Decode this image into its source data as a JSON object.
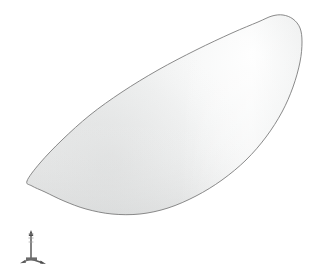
{
  "viewport": {
    "name": "3d-model-viewport",
    "width": 316,
    "height": 274,
    "background_color": "#ffffff",
    "render_mode": "shaded",
    "caption": ""
  },
  "model": {
    "name": "curved-shell-surface",
    "description": "Crescent / lens shaped doubly-curved shell surface",
    "fill_color": "#ececec",
    "highlight_color": "#fafafa",
    "shadow_color": "#dcdddd",
    "edge_color": "#7d7d7d",
    "edge_width": 0.9,
    "outline_points": [
      [
        27,
        181
      ],
      [
        40,
        163
      ],
      [
        62,
        140
      ],
      [
        90,
        115
      ],
      [
        122,
        92
      ],
      [
        158,
        70
      ],
      [
        196,
        50
      ],
      [
        232,
        33
      ],
      [
        258,
        22
      ],
      [
        272,
        16
      ],
      [
        283,
        15
      ],
      [
        293,
        19
      ],
      [
        300,
        28
      ],
      [
        302,
        42
      ],
      [
        300,
        62
      ],
      [
        293,
        87
      ],
      [
        282,
        112
      ],
      [
        266,
        137
      ],
      [
        246,
        160
      ],
      [
        222,
        180
      ],
      [
        196,
        196
      ],
      [
        168,
        208
      ],
      [
        140,
        214
      ],
      [
        112,
        214
      ],
      [
        86,
        209
      ],
      [
        64,
        201
      ],
      [
        45,
        192
      ],
      [
        32,
        186
      ],
      [
        27,
        181
      ]
    ],
    "highlight_center": [
      255,
      55
    ],
    "shade_center": [
      110,
      165
    ]
  },
  "axis_triad": {
    "name": "orientation-triad",
    "origin": [
      31,
      259
    ],
    "color": "#5a5a5a",
    "axes": [
      {
        "label": "",
        "name": "axis-y-up",
        "end": [
          31,
          233
        ],
        "arrow": "up"
      },
      {
        "label": "",
        "name": "axis-x-diagonal",
        "end": [
          45,
          266
        ],
        "arrow": "down-right"
      },
      {
        "label": "",
        "name": "axis-z-short",
        "end": [
          23,
          264
        ],
        "arrow": "down-left"
      }
    ]
  }
}
